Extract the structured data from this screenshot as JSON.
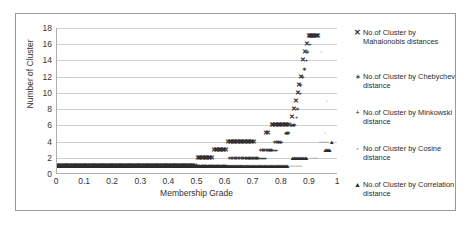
{
  "chart_data": {
    "type": "scatter",
    "title": "",
    "xlabel": "Membership Grade",
    "ylabel": "Number of Cluster",
    "xlim": [
      0,
      1
    ],
    "ylim": [
      0,
      18
    ],
    "grid": true,
    "legend_position": "right",
    "xticks": [
      "0",
      "0.1",
      "0.2",
      "0.3",
      "0.4",
      "0.5",
      "0.6",
      "0.7",
      "0.8",
      "0.9",
      "1"
    ],
    "xtick_values": [
      0,
      0.1,
      0.2,
      0.3,
      0.4,
      0.5,
      0.6,
      0.7,
      0.8,
      0.9,
      1
    ],
    "yticks": [
      "0",
      "2",
      "4",
      "6",
      "8",
      "10",
      "12",
      "14",
      "16",
      "18"
    ],
    "ytick_values": [
      0,
      2,
      4,
      6,
      8,
      10,
      12,
      14,
      16,
      18
    ],
    "series": [
      {
        "name": "No.of Cluster by Mahalonobis distances",
        "marker": "x",
        "marker_glyph": "✕",
        "color": "#2b2b2b",
        "points": [
          [
            0.0,
            1
          ],
          [
            0.04,
            1
          ],
          [
            0.08,
            1
          ],
          [
            0.12,
            1
          ],
          [
            0.16,
            1
          ],
          [
            0.2,
            1
          ],
          [
            0.24,
            1
          ],
          [
            0.28,
            1
          ],
          [
            0.32,
            1
          ],
          [
            0.36,
            1
          ],
          [
            0.4,
            1
          ],
          [
            0.44,
            1
          ],
          [
            0.46,
            1
          ],
          [
            0.48,
            1
          ],
          [
            0.49,
            1
          ],
          [
            0.5,
            2
          ],
          [
            0.51,
            2
          ],
          [
            0.52,
            2
          ],
          [
            0.53,
            2
          ],
          [
            0.54,
            2
          ],
          [
            0.55,
            2
          ],
          [
            0.56,
            3
          ],
          [
            0.57,
            3
          ],
          [
            0.58,
            3
          ],
          [
            0.59,
            3
          ],
          [
            0.6,
            3
          ],
          [
            0.61,
            4
          ],
          [
            0.62,
            4
          ],
          [
            0.63,
            4
          ],
          [
            0.64,
            4
          ],
          [
            0.65,
            4
          ],
          [
            0.66,
            4
          ],
          [
            0.67,
            4
          ],
          [
            0.68,
            4
          ],
          [
            0.69,
            4
          ],
          [
            0.7,
            4
          ],
          [
            0.745,
            5
          ],
          [
            0.75,
            5
          ],
          [
            0.765,
            6
          ],
          [
            0.775,
            6
          ],
          [
            0.785,
            6
          ],
          [
            0.795,
            6
          ],
          [
            0.805,
            6
          ],
          [
            0.815,
            6
          ],
          [
            0.825,
            6
          ],
          [
            0.838,
            7
          ],
          [
            0.845,
            8
          ],
          [
            0.852,
            9
          ],
          [
            0.858,
            10
          ],
          [
            0.862,
            11
          ],
          [
            0.868,
            12
          ],
          [
            0.876,
            14
          ],
          [
            0.882,
            15
          ],
          [
            0.888,
            16
          ],
          [
            0.898,
            17
          ],
          [
            0.905,
            17
          ],
          [
            0.912,
            17
          ],
          [
            0.92,
            17
          ],
          [
            0.928,
            17
          ]
        ]
      },
      {
        "name": "No.of Cluster by Chebychev distance",
        "marker": "asterisk",
        "marker_glyph": "∗",
        "color": "#333333",
        "points": [
          [
            0.0,
            1
          ],
          [
            0.05,
            1
          ],
          [
            0.1,
            1
          ],
          [
            0.15,
            1
          ],
          [
            0.2,
            1
          ],
          [
            0.25,
            1
          ],
          [
            0.3,
            1
          ],
          [
            0.35,
            1
          ],
          [
            0.4,
            1
          ],
          [
            0.45,
            1
          ],
          [
            0.5,
            1
          ],
          [
            0.55,
            1
          ],
          [
            0.58,
            1
          ],
          [
            0.6,
            1
          ],
          [
            0.615,
            2
          ],
          [
            0.625,
            2
          ],
          [
            0.635,
            2
          ],
          [
            0.645,
            2
          ],
          [
            0.655,
            2
          ],
          [
            0.665,
            2
          ],
          [
            0.675,
            2
          ],
          [
            0.685,
            2
          ],
          [
            0.695,
            2
          ],
          [
            0.705,
            2
          ],
          [
            0.715,
            2
          ],
          [
            0.725,
            3
          ],
          [
            0.735,
            3
          ],
          [
            0.745,
            3
          ],
          [
            0.755,
            3
          ],
          [
            0.765,
            3
          ],
          [
            0.775,
            4
          ],
          [
            0.785,
            4
          ],
          [
            0.795,
            4
          ],
          [
            0.815,
            5
          ],
          [
            0.825,
            5
          ],
          [
            0.836,
            6
          ],
          [
            0.846,
            6
          ],
          [
            0.856,
            8
          ],
          [
            0.866,
            11
          ],
          [
            0.872,
            12
          ],
          [
            0.88,
            13
          ],
          [
            0.89,
            15
          ],
          [
            0.9,
            17
          ],
          [
            0.91,
            17
          ],
          [
            0.918,
            17
          ]
        ]
      },
      {
        "name": "No.of Cluster by Minkowski distance",
        "marker": "plus",
        "marker_glyph": "+",
        "color": "#2b2b2b",
        "points": [
          [
            0.0,
            1
          ],
          [
            0.06,
            1
          ],
          [
            0.12,
            1
          ],
          [
            0.18,
            1
          ],
          [
            0.24,
            1
          ],
          [
            0.3,
            1
          ],
          [
            0.36,
            1
          ],
          [
            0.42,
            1
          ],
          [
            0.48,
            1
          ],
          [
            0.54,
            1
          ],
          [
            0.6,
            1
          ],
          [
            0.64,
            1
          ],
          [
            0.66,
            1
          ],
          [
            0.672,
            2
          ],
          [
            0.682,
            2
          ],
          [
            0.692,
            2
          ],
          [
            0.702,
            2
          ],
          [
            0.712,
            2
          ],
          [
            0.722,
            2
          ],
          [
            0.732,
            2
          ],
          [
            0.742,
            2
          ],
          [
            0.752,
            3
          ],
          [
            0.762,
            3
          ],
          [
            0.772,
            3
          ],
          [
            0.782,
            3
          ],
          [
            0.792,
            4
          ],
          [
            0.8,
            4
          ],
          [
            0.812,
            5
          ],
          [
            0.82,
            5
          ],
          [
            0.832,
            6
          ],
          [
            0.842,
            6
          ],
          [
            0.852,
            7
          ],
          [
            0.866,
            10
          ],
          [
            0.88,
            13
          ],
          [
            0.888,
            14
          ],
          [
            0.9,
            16
          ]
        ]
      },
      {
        "name": "No.of Cluster by Cosine distance",
        "marker": "circle",
        "marker_glyph": "◦",
        "color": "#6a6a6a",
        "points": [
          [
            0.0,
            1
          ],
          [
            0.07,
            1
          ],
          [
            0.14,
            1
          ],
          [
            0.21,
            1
          ],
          [
            0.28,
            1
          ],
          [
            0.35,
            1
          ],
          [
            0.42,
            1
          ],
          [
            0.49,
            1
          ],
          [
            0.56,
            1
          ],
          [
            0.63,
            1
          ],
          [
            0.7,
            1
          ],
          [
            0.77,
            1
          ],
          [
            0.82,
            1
          ],
          [
            0.85,
            1
          ],
          [
            0.87,
            1
          ],
          [
            0.905,
            2
          ],
          [
            0.915,
            2
          ],
          [
            0.925,
            2
          ],
          [
            0.935,
            4
          ],
          [
            0.945,
            4
          ],
          [
            0.955,
            4
          ],
          [
            0.965,
            4
          ],
          [
            0.955,
            5
          ],
          [
            0.96,
            9
          ],
          [
            0.94,
            15
          ]
        ]
      },
      {
        "name": "No.of Cluster by Correlation distance",
        "marker": "triangle",
        "marker_glyph": "▲",
        "color": "#2b2b2b",
        "points": [
          [
            0.0,
            1
          ],
          [
            0.08,
            1
          ],
          [
            0.16,
            1
          ],
          [
            0.24,
            1
          ],
          [
            0.32,
            1
          ],
          [
            0.4,
            1
          ],
          [
            0.48,
            1
          ],
          [
            0.56,
            1
          ],
          [
            0.64,
            1
          ],
          [
            0.72,
            1
          ],
          [
            0.78,
            1
          ],
          [
            0.82,
            1
          ],
          [
            0.838,
            2
          ],
          [
            0.848,
            2
          ],
          [
            0.858,
            2
          ],
          [
            0.868,
            2
          ],
          [
            0.878,
            2
          ],
          [
            0.888,
            2
          ],
          [
            0.955,
            3
          ],
          [
            0.963,
            3
          ],
          [
            0.971,
            3
          ],
          [
            0.978,
            4
          ]
        ]
      }
    ]
  },
  "legend": {
    "items": [
      {
        "marker": "✕",
        "label": "No.of Cluster by Mahalonobis distances"
      },
      {
        "marker": "∗",
        "label": "No.of Cluster by Chebychev distance"
      },
      {
        "marker": "+",
        "label": "No.of Cluster by Minkowski distance"
      },
      {
        "marker": "◦",
        "label": "No.of Cluster by Cosine distance"
      },
      {
        "marker": "▲",
        "label": "No.of Cluster by Correlation distance"
      }
    ]
  },
  "colors": {
    "grid": "#cfcfcf",
    "axis": "#b0b0b0",
    "border": "#9a9a9a",
    "text": "#333333",
    "marker": "#2b2b2b"
  }
}
